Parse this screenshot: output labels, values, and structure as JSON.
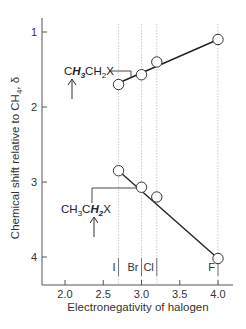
{
  "chart_data": {
    "type": "scatter",
    "title": "",
    "xlabel": "Electronegativity of halogen",
    "ylabel": "Chemical shift relative to CH4, δ",
    "ylabel_parts": {
      "main": "Chemical shift relative to CH",
      "sub": "4",
      "tail": ", δ"
    },
    "xlim": [
      1.75,
      4.1
    ],
    "ylim": [
      4.2,
      0.8
    ],
    "y_inverted": true,
    "xticks": [
      "2.0",
      "2.5",
      "3.0",
      "3.5",
      "4.0"
    ],
    "yticks": [
      "1",
      "2",
      "3",
      "4"
    ],
    "grid": false,
    "halogens": [
      {
        "label": "I",
        "x": 2.7
      },
      {
        "label": "Br",
        "x": 3.0
      },
      {
        "label": "Cl",
        "x": 3.2
      },
      {
        "label": "F",
        "x": 4.0
      }
    ],
    "series": [
      {
        "name": "CH3CH2X (CH3 protons)",
        "label_parts": [
          "C",
          "H",
          "3",
          "CH",
          "2",
          "X"
        ],
        "x": [
          2.7,
          3.0,
          3.2,
          4.0
        ],
        "values": [
          1.7,
          1.57,
          1.4,
          1.1
        ],
        "fit_line": {
          "x": [
            2.7,
            4.0
          ],
          "y": [
            1.68,
            1.1
          ]
        }
      },
      {
        "name": "CH3CH2X (CH2 protons)",
        "label_parts": [
          "CH",
          "3",
          "C",
          "H",
          "2",
          "X"
        ],
        "x": [
          2.7,
          3.0,
          3.2,
          4.0
        ],
        "values": [
          2.85,
          3.07,
          3.2,
          4.02
        ],
        "fit_line": {
          "x": [
            2.7,
            4.0
          ],
          "y": [
            2.85,
            4.02
          ]
        }
      }
    ]
  }
}
